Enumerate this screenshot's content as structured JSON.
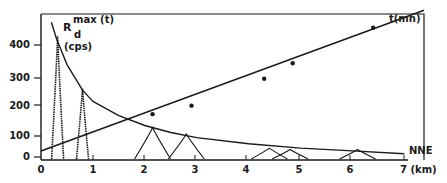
{
  "chart_data": {
    "type": "line",
    "title": "",
    "xlabel": "(km)",
    "direction_label": "NNE",
    "ylabel": "R_d max(t) (cps)",
    "xlim": [
      0,
      7.2
    ],
    "ylim": [
      0,
      480
    ],
    "x_ticks": [
      "0",
      "1",
      "2",
      "3",
      "4",
      "5",
      "6",
      "7 (km)"
    ],
    "y_ticks": [
      "0",
      "100",
      "200",
      "300",
      "400"
    ],
    "grid": false,
    "annotations": {
      "envelope_label_main": "R",
      "envelope_label_sub": "d",
      "envelope_label_sup": "max (t)",
      "envelope_unit": "(cps)",
      "time_label": "t(mn)",
      "direction": "NNE"
    },
    "series": [
      {
        "name": "R_d max(t) envelope",
        "style": "solid curve",
        "x": [
          0.2,
          0.3,
          0.5,
          0.8,
          1.0,
          1.5,
          2.0,
          2.5,
          3.0,
          4.0,
          5.0,
          6.0,
          7.0
        ],
        "y": [
          480,
          420,
          330,
          240,
          200,
          150,
          115,
          90,
          72,
          50,
          35,
          25,
          15
        ]
      },
      {
        "name": "t(mn) linear fit",
        "style": "solid straight line",
        "x": [
          0,
          7.2
        ],
        "y": [
          25,
          510
        ]
      },
      {
        "name": "t(mn) observed points",
        "style": "markers",
        "x": [
          2.15,
          2.9,
          4.3,
          4.85,
          6.4
        ],
        "y": [
          155,
          185,
          280,
          335,
          460
        ]
      },
      {
        "name": "individual pass peaks",
        "style": "peaked curves (dotted/solid)",
        "peaks": [
          {
            "center": 0.32,
            "height": 430
          },
          {
            "center": 0.8,
            "height": 245
          },
          {
            "center": 2.15,
            "height": 108
          },
          {
            "center": 2.8,
            "height": 85
          },
          {
            "center": 4.4,
            "height": 35
          },
          {
            "center": 4.8,
            "height": 30
          },
          {
            "center": 6.1,
            "height": 30
          }
        ]
      }
    ]
  }
}
